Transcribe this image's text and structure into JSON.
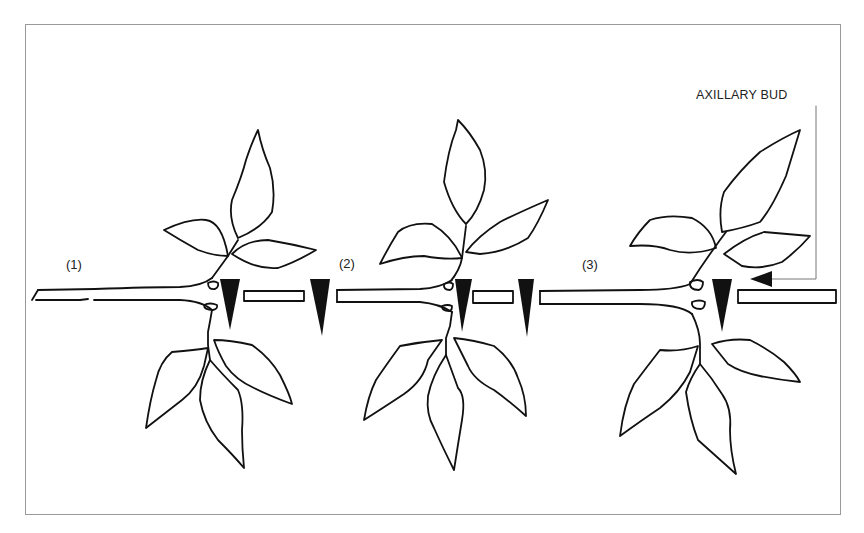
{
  "figure": {
    "panels": [
      {
        "label": "(1)"
      },
      {
        "label": "(2)"
      },
      {
        "label": "(3)"
      }
    ],
    "callout": {
      "label": "AXILLARY BUD"
    },
    "colors": {
      "line": "#111111",
      "frame": "#9a9a9a",
      "background": "#ffffff"
    }
  }
}
